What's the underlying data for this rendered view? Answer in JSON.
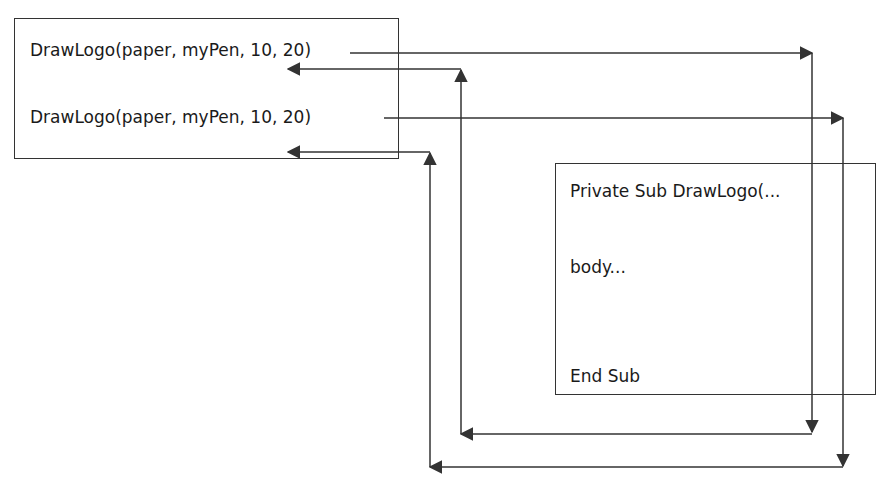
{
  "caller": {
    "call_1": "DrawLogo(paper, myPen, 10, 20)",
    "call_2": "DrawLogo(paper, myPen, 10, 20)"
  },
  "procedure": {
    "header": "Private Sub DrawLogo(...",
    "body": "body...",
    "footer": "End Sub"
  },
  "colors": {
    "line": "#333333",
    "text": "#1a1a1a",
    "background": "#ffffff"
  }
}
